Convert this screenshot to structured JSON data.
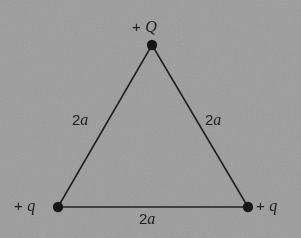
{
  "figure": {
    "background_color": "#9a9a9a",
    "ink_color": "#1c1c1c"
  },
  "vertices": [
    {
      "id": "apex",
      "name": "top-vertex",
      "x": 152,
      "y": 45,
      "label": "+ Q",
      "sign": "+",
      "symbol": "Q"
    },
    {
      "id": "bottom_left",
      "name": "bottom-left-vertex",
      "x": 58,
      "y": 207,
      "label": "+ q",
      "sign": "+",
      "symbol": "q"
    },
    {
      "id": "bottom_right",
      "name": "bottom-right-vertex",
      "x": 248,
      "y": 207,
      "label": "+ q",
      "sign": "+",
      "symbol": "q"
    }
  ],
  "edges": [
    {
      "id": "left_side",
      "name": "left-side",
      "label": "2a",
      "number": "2",
      "symbol": "a",
      "from": "bottom_left",
      "to": "apex"
    },
    {
      "id": "right_side",
      "name": "right-side",
      "label": "2a",
      "number": "2",
      "symbol": "a",
      "from": "apex",
      "to": "bottom_right"
    },
    {
      "id": "base",
      "name": "base-side",
      "label": "2a",
      "number": "2",
      "symbol": "a",
      "from": "bottom_left",
      "to": "bottom_right"
    }
  ],
  "labels": {
    "apex_charge": {
      "sign": "+",
      "symbol": "Q"
    },
    "left_charge": {
      "sign": "+",
      "symbol": "q"
    },
    "right_charge": {
      "sign": "+",
      "symbol": "q"
    },
    "left_length": {
      "number": "2",
      "symbol": "a"
    },
    "right_length": {
      "number": "2",
      "symbol": "a"
    },
    "base_length": {
      "number": "2",
      "symbol": "a"
    }
  }
}
